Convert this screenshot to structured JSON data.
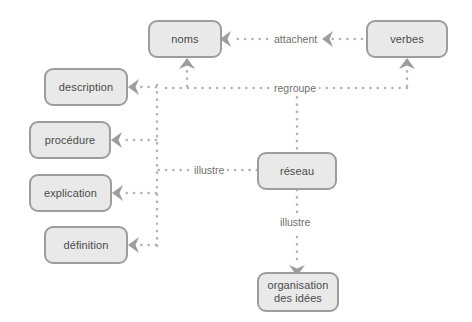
{
  "diagram": {
    "colors": {
      "node_fill": "#e9e9e9",
      "node_border": "#9d9d9d",
      "node_text": "#4b4b4b",
      "edge": "#b3b3b3",
      "edge_label_text": "#6f6f6f",
      "background": "#ffffff"
    },
    "nodes": [
      {
        "id": "noms",
        "label": "noms"
      },
      {
        "id": "verbes",
        "label": "verbes"
      },
      {
        "id": "description",
        "label": "description"
      },
      {
        "id": "procedure",
        "label": "procédure"
      },
      {
        "id": "explication",
        "label": "explication"
      },
      {
        "id": "definition",
        "label": "définition"
      },
      {
        "id": "reseau",
        "label": "réseau"
      },
      {
        "id": "organisation",
        "label": "organisation\ndes idées"
      }
    ],
    "edge_labels": [
      {
        "id": "attachent",
        "label": "attachent"
      },
      {
        "id": "regroupe",
        "label": "regroupe"
      },
      {
        "id": "illustre-left",
        "label": "illustre"
      },
      {
        "id": "illustre-bottom",
        "label": "illustre"
      }
    ]
  }
}
